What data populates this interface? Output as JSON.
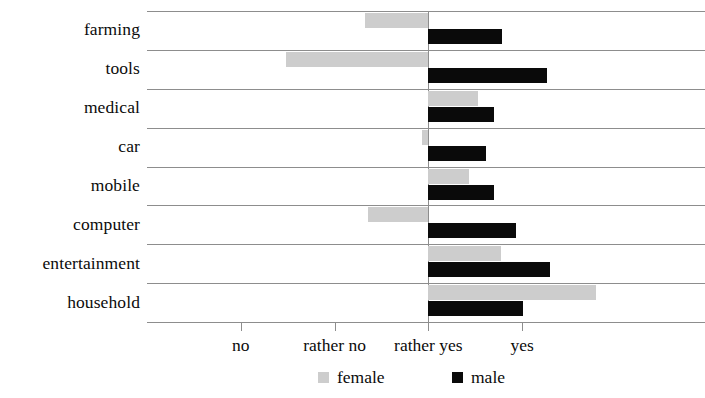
{
  "chart_data": {
    "type": "bar",
    "orientation": "horizontal",
    "title": "",
    "xlabel": "",
    "ylabel": "",
    "grid": true,
    "legend_position": "bottom",
    "baseline_value": 0,
    "baseline_tick_label": "rather yes",
    "axis_tick_labels": [
      "no",
      "rather no",
      "rather yes",
      "yes"
    ],
    "axis_tick_values": [
      -2,
      -1,
      0,
      1
    ],
    "xlim": [
      -3,
      2.95
    ],
    "categories": [
      "farming",
      "tools",
      "medical",
      "car",
      "mobile",
      "computer",
      "entertainment",
      "household"
    ],
    "series": [
      {
        "name": "female",
        "color": "#cdcdcd",
        "values": [
          -0.68,
          -1.52,
          0.53,
          -0.07,
          0.43,
          -0.64,
          0.77,
          1.79
        ]
      },
      {
        "name": "male",
        "color": "#0a0a0a",
        "values": [
          0.79,
          1.26,
          0.7,
          0.61,
          0.7,
          0.94,
          1.3,
          1.01
        ]
      }
    ]
  },
  "legend": {
    "items": [
      {
        "label": "female",
        "swatch": "female-color-swatch"
      },
      {
        "label": "male",
        "swatch": "male-color-swatch"
      }
    ]
  },
  "colors": {
    "female": "#cdcdcd",
    "male": "#0a0a0a",
    "grid": "#8d8d8d",
    "text": "#0b0b0b",
    "background": "#ffffff"
  }
}
